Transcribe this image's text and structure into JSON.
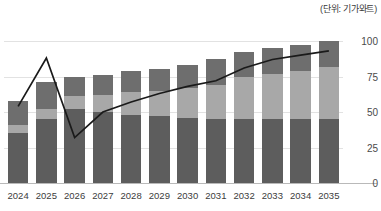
{
  "unit_note": "(단위: 기가와트)",
  "chart_data": {
    "type": "bar",
    "title": "",
    "subtitle": "",
    "xlabel": "",
    "ylabel": "",
    "unit": "기가와트",
    "unit_label": "(단위: 기가와트)",
    "grid": true,
    "legend_position": "none",
    "ylim": [
      0,
      112
    ],
    "yticks": [
      0,
      25,
      50,
      75,
      100
    ],
    "ytick_labels": [
      "0",
      "25",
      "50",
      "75",
      "100"
    ],
    "categories": [
      "2024",
      "2025",
      "2026",
      "2027",
      "2028",
      "2029",
      "2030",
      "2031",
      "2032",
      "2033",
      "2034",
      "2035"
    ],
    "stacked": true,
    "series": [
      {
        "name": "하단 구간",
        "color": "#5d5d5d",
        "values": [
          35,
          45,
          52,
          50,
          48,
          47,
          46,
          45,
          45,
          45,
          45,
          45
        ]
      },
      {
        "name": "중단 구간",
        "color": "#a8a8a8",
        "values": [
          6,
          7,
          9,
          12,
          16,
          18,
          21,
          24,
          30,
          32,
          34,
          37
        ]
      },
      {
        "name": "상단 구간",
        "color": "#6e6e6e",
        "values": [
          17,
          19,
          14,
          14,
          15,
          15,
          16,
          18,
          17,
          18,
          18,
          18
        ]
      }
    ],
    "bar_totals": [
      58,
      71,
      75,
      76,
      79,
      80,
      83,
      87,
      92,
      95,
      97,
      100
    ],
    "line_series": {
      "name": "추세선",
      "color": "#1a1a1a",
      "values": [
        54,
        88,
        32,
        50,
        57,
        63,
        68,
        72,
        81,
        87,
        90,
        93
      ]
    }
  }
}
